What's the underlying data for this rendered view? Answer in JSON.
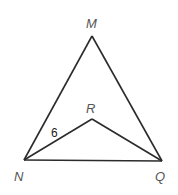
{
  "diagram": {
    "type": "geometry-figure",
    "points": {
      "M": {
        "label": "M",
        "x": 92,
        "y": 36
      },
      "N": {
        "label": "N",
        "x": 24,
        "y": 160
      },
      "Q": {
        "label": "Q",
        "x": 162,
        "y": 161
      },
      "R": {
        "label": "R",
        "x": 92,
        "y": 119
      }
    },
    "segments": [
      {
        "from": "M",
        "to": "N"
      },
      {
        "from": "M",
        "to": "Q"
      },
      {
        "from": "N",
        "to": "Q"
      },
      {
        "from": "N",
        "to": "R"
      },
      {
        "from": "R",
        "to": "Q"
      }
    ],
    "measure_labels": [
      {
        "segment": "NR",
        "text": "6"
      }
    ]
  }
}
